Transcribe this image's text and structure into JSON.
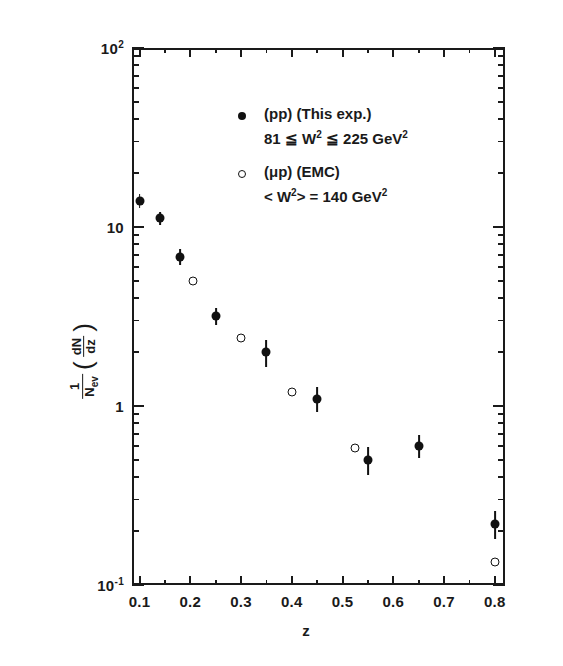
{
  "figure": {
    "background": "#ffffff",
    "ink_color": "#1a1a1a"
  },
  "chart_data": {
    "type": "scatter",
    "title": "",
    "xlabel": "z",
    "ylabel": "1/N_ev (dN/dz)",
    "xscale": "linear",
    "yscale": "log",
    "xlim": [
      0.085,
      0.82
    ],
    "ylim": [
      0.1,
      100
    ],
    "grid": false,
    "legend_position": "upper-right-inside",
    "xticks": [
      "0.1",
      "0.2",
      "0.3",
      "0.4",
      "0.5",
      "0.6",
      "0.7",
      "0.8"
    ],
    "xtick_values": [
      0.1,
      0.2,
      0.3,
      0.4,
      0.5,
      0.6,
      0.7,
      0.8
    ],
    "ytick_labels": [
      "10",
      "1",
      "10"
    ],
    "ytick_top_label": "10",
    "ytick_top_exp": "2",
    "ytick_bottom_label": "10",
    "ytick_bottom_exp": "-1",
    "ytick_mid_upper": "10",
    "ytick_mid_lower": "1",
    "series": [
      {
        "name": "(pp) (This exp.)",
        "marker": "filled-circle",
        "x": [
          0.1,
          0.14,
          0.18,
          0.25,
          0.35,
          0.45,
          0.55,
          0.65,
          0.8
        ],
        "y": [
          14.0,
          11.2,
          6.8,
          3.2,
          2.0,
          1.1,
          0.5,
          0.6,
          0.22
        ],
        "yerr_low": [
          1.2,
          0.9,
          0.7,
          0.35,
          0.35,
          0.18,
          0.09,
          0.09,
          0.04
        ],
        "yerr_high": [
          1.2,
          0.9,
          0.7,
          0.35,
          0.35,
          0.18,
          0.09,
          0.09,
          0.04
        ]
      },
      {
        "name": "(μp) (EMC)",
        "marker": "open-circle",
        "x": [
          0.205,
          0.3,
          0.4,
          0.525,
          0.8
        ],
        "y": [
          5.0,
          2.4,
          1.2,
          0.58,
          0.135
        ],
        "yerr_low": [
          0,
          0,
          0,
          0,
          0
        ],
        "yerr_high": [
          0,
          0,
          0,
          0,
          0
        ]
      }
    ],
    "annotations": [
      "(pp) (This exp.)",
      "81 ≦ W² ≦ 225 GeV²",
      "(μp) (EMC)",
      "< W² > = 140 GeV²"
    ]
  },
  "legend": {
    "entries": [
      {
        "marker": "filled-circle",
        "label": "(pp) (This exp.)",
        "detail_pre": "81 ≦ W",
        "detail_exp1": "2",
        "detail_mid": " ≦ 225 GeV",
        "detail_exp2": "2"
      },
      {
        "marker": "open-circle",
        "label": "(μp) (EMC)",
        "detail_pre": "< W",
        "detail_exp1": "2",
        "detail_mid": "> = 140 GeV",
        "detail_exp2": "2"
      }
    ]
  },
  "axes": {
    "x_title": "z",
    "y_title_num": "1",
    "y_title_den": "N",
    "y_title_den_sub": "ev",
    "y_title_frac_num": "dN",
    "y_title_frac_den": "dz",
    "y_top_mantissa": "10",
    "y_top_exponent": "2",
    "y_dec_10": "10",
    "y_dec_1": "1",
    "y_bottom_mantissa": "10",
    "y_bottom_exponent": "-1"
  }
}
